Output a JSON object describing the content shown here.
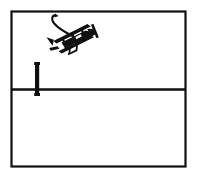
{
  "illustration": {
    "title": "Biplane flying over a bordered field with a vertical post",
    "style": "black-and-white line drawing",
    "background_color": "#ffffff",
    "ink_color": "#101010"
  },
  "frame": {
    "name": "outer-rectangle",
    "x": 11,
    "y": 11,
    "width": 175,
    "height": 156,
    "stroke_width": 2,
    "fill": "none"
  },
  "divider": {
    "name": "horizontal-divider-line",
    "x1": 11,
    "y1": 89,
    "x2": 186,
    "y2": 89,
    "stroke_width": 2
  },
  "post": {
    "name": "vertical-post",
    "x": 36,
    "y_top": 62,
    "y_bottom": 96,
    "width": 4,
    "description": "short thick vertical bar crossing the divider line near the left side"
  },
  "airplane": {
    "name": "biplane",
    "center_x": 76,
    "center_y": 41,
    "rotation_degrees": -22,
    "description": "small solid-black biplane with upper and lower wings, struts, tail fin and propeller, banking to the upper right"
  },
  "trail": {
    "name": "flight-path-arrow",
    "start_x": 72,
    "start_y": 35,
    "end_x": 51,
    "end_y": 18,
    "arrowhead": "hooked tip curling right at the upper end",
    "description": "curved trail line from the plane up and to the left ending in a small hook arrow"
  },
  "colors": {
    "ink": "#101010",
    "paper": "#ffffff"
  }
}
